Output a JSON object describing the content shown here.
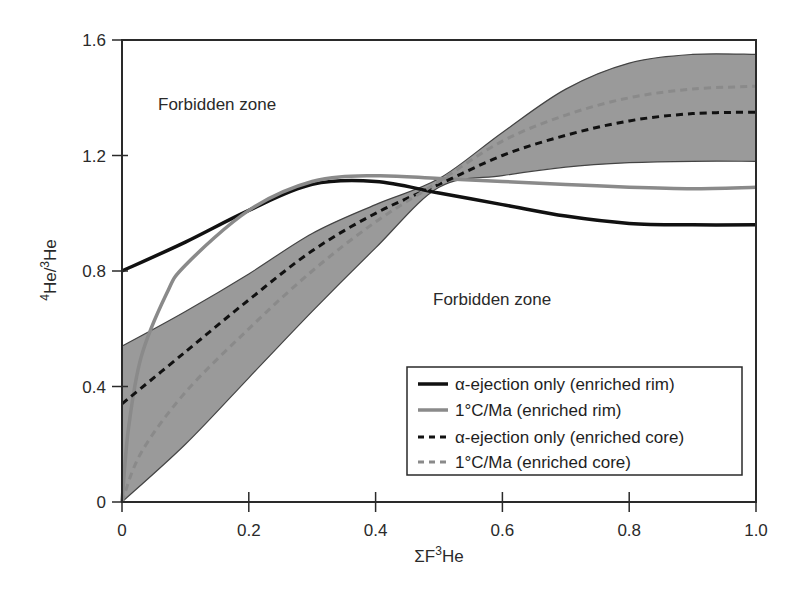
{
  "chart_data": {
    "type": "line",
    "title": "",
    "xlabel": "ΣF³He",
    "ylabel": "⁴He/³He",
    "xlim": [
      0,
      1.0
    ],
    "ylim": [
      0,
      1.6
    ],
    "xticks": [
      "0",
      "0.2",
      "0.4",
      "0.6",
      "0.8",
      "1.0"
    ],
    "yticks": [
      "0",
      "0.4",
      "0.8",
      "1.2",
      "1.6"
    ],
    "grid": false,
    "legend_position": "lower right",
    "annotations": [
      {
        "text": "Forbidden zone",
        "x": 0.06,
        "y": 1.42
      },
      {
        "text": "Forbidden zone",
        "x": 0.5,
        "y": 0.72
      }
    ],
    "band": {
      "name": "shaded envelope",
      "color": "#9a9a9a",
      "x": [
        0,
        0.1,
        0.2,
        0.3,
        0.4,
        0.5,
        0.6,
        0.7,
        0.8,
        0.9,
        1.0
      ],
      "upper": [
        0.54,
        0.66,
        0.79,
        0.93,
        1.03,
        1.12,
        1.28,
        1.43,
        1.52,
        1.55,
        1.55
      ],
      "lower": [
        0.0,
        0.2,
        0.43,
        0.66,
        0.88,
        1.09,
        1.13,
        1.16,
        1.175,
        1.18,
        1.18
      ]
    },
    "x": [
      0,
      0.1,
      0.2,
      0.3,
      0.4,
      0.5,
      0.6,
      0.7,
      0.8,
      0.9,
      1.0
    ],
    "series": [
      {
        "name": "α-ejection only (enriched rim)",
        "style": "solid",
        "color": "#111111",
        "width": 3.5,
        "values": [
          0.8,
          0.9,
          1.01,
          1.1,
          1.11,
          1.07,
          1.03,
          0.99,
          0.965,
          0.96,
          0.96
        ]
      },
      {
        "name": "1°C/Ma (enriched rim)",
        "style": "solid",
        "color": "#8a8a8a",
        "width": 3.5,
        "values": [
          0.0,
          0.82,
          1.01,
          1.11,
          1.13,
          1.12,
          1.11,
          1.1,
          1.09,
          1.085,
          1.09
        ]
      },
      {
        "name": "α-ejection only (enriched core)",
        "style": "dashed",
        "color": "#111111",
        "width": 3,
        "values": [
          0.34,
          0.52,
          0.7,
          0.87,
          1.0,
          1.1,
          1.2,
          1.27,
          1.32,
          1.345,
          1.35
        ]
      },
      {
        "name": "1°C/Ma (enriched core)",
        "style": "dashed",
        "color": "#8a8a8a",
        "width": 3,
        "values": [
          0.0,
          0.38,
          0.6,
          0.8,
          0.97,
          1.11,
          1.25,
          1.34,
          1.4,
          1.43,
          1.44
        ]
      }
    ]
  },
  "labels": {
    "forbidden_upper": "Forbidden zone",
    "forbidden_lower": "Forbidden zone",
    "xlabel_sigma": "ΣF",
    "xlabel_sup": "3",
    "xlabel_rest": "He",
    "ylabel_sup1": "4",
    "ylabel_mid": "He/",
    "ylabel_sup2": "3",
    "ylabel_rest": "He"
  },
  "legend": [
    {
      "label": "α-ejection only (enriched rim)"
    },
    {
      "label": "1°C/Ma (enriched rim)"
    },
    {
      "label": "α-ejection only (enriched core)"
    },
    {
      "label": "1°C/Ma (enriched core)"
    }
  ]
}
